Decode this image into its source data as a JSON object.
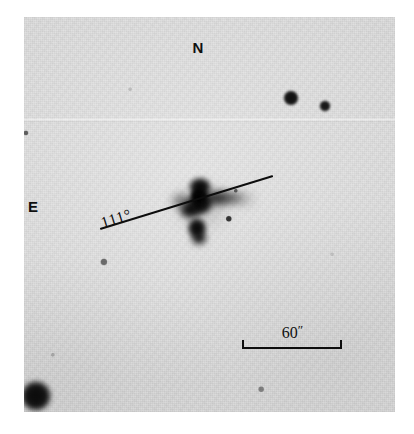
{
  "figure": {
    "type": "astronomical-plate-negative",
    "background_color": "#dcdcdc",
    "ink_color": "#0d0d0d",
    "frame": {
      "x": 24,
      "y": 17,
      "width": 371,
      "height": 395
    }
  },
  "annotations": {
    "position_angle": {
      "label": "111°",
      "line": {
        "x1": 100,
        "y1": 228,
        "x2": 273,
        "y2": 175
      },
      "label_x": 104,
      "label_y": 214,
      "angle_deg": -17
    },
    "compass": [
      {
        "name": "north-label",
        "label": "N",
        "x": 198,
        "y": 47
      },
      {
        "name": "east-label",
        "label": "E",
        "x": 33,
        "y": 206
      }
    ],
    "scale_bar": {
      "label": "60",
      "unit": "″",
      "x1": 242,
      "x2": 342,
      "y": 347
    }
  },
  "sources": [
    {
      "name": "star-ne-bright",
      "x": 291,
      "y": 98,
      "r": 7.5,
      "opacity": 0.96
    },
    {
      "name": "star-ne-faint",
      "x": 325,
      "y": 106,
      "r": 5.5,
      "opacity": 0.93
    },
    {
      "name": "star-sw-bright",
      "x": 36,
      "y": 396,
      "r": 15,
      "opacity": 0.98
    },
    {
      "name": "star-field-1",
      "x": 104,
      "y": 262,
      "r": 3.6,
      "opacity": 0.55
    },
    {
      "name": "star-field-2",
      "x": 229,
      "y": 219,
      "r": 3.2,
      "opacity": 0.8
    },
    {
      "name": "star-field-3",
      "x": 236,
      "y": 191,
      "r": 2.2,
      "opacity": 0.55
    },
    {
      "name": "star-field-4",
      "x": 261,
      "y": 389,
      "r": 2.8,
      "opacity": 0.42
    },
    {
      "name": "star-field-5",
      "x": 53,
      "y": 355,
      "r": 2.2,
      "opacity": 0.22
    },
    {
      "name": "star-edge-speck",
      "x": 26,
      "y": 133,
      "r": 2.6,
      "opacity": 0.6
    },
    {
      "name": "star-field-6",
      "x": 130,
      "y": 89,
      "r": 1.8,
      "opacity": 0.14
    },
    {
      "name": "star-field-7",
      "x": 332,
      "y": 254,
      "r": 1.8,
      "opacity": 0.12
    }
  ],
  "central_object": {
    "name": "peculiar-galaxy",
    "components": [
      {
        "name": "core-main",
        "x": 200,
        "y": 203,
        "rx": 15,
        "ry": 14,
        "opacity": 1.0,
        "blur": 2
      },
      {
        "name": "core-north",
        "x": 200,
        "y": 187,
        "rx": 13,
        "ry": 11,
        "opacity": 1.0,
        "blur": 2
      },
      {
        "name": "nucleus",
        "x": 199,
        "y": 196,
        "rx": 10,
        "ry": 10,
        "opacity": 1.0,
        "blur": 1
      },
      {
        "name": "lobe-southwest",
        "x": 190,
        "y": 210,
        "rx": 12,
        "ry": 10,
        "opacity": 0.96,
        "blur": 3
      },
      {
        "name": "lobe-south",
        "x": 197,
        "y": 228,
        "rx": 11,
        "ry": 12,
        "opacity": 1.0,
        "blur": 2
      },
      {
        "name": "lobe-south-tip",
        "x": 199,
        "y": 238,
        "rx": 9,
        "ry": 8,
        "opacity": 0.95,
        "blur": 3
      },
      {
        "name": "tail-inner",
        "x": 216,
        "y": 198,
        "rx": 16,
        "ry": 8,
        "opacity": 0.9,
        "blur": 4
      },
      {
        "name": "tail-mid",
        "x": 231,
        "y": 198,
        "rx": 14,
        "ry": 6,
        "opacity": 0.72,
        "blur": 5
      },
      {
        "name": "tail-outer",
        "x": 244,
        "y": 199,
        "rx": 11,
        "ry": 4,
        "opacity": 0.45,
        "blur": 6
      },
      {
        "name": "halo-west",
        "x": 182,
        "y": 201,
        "rx": 12,
        "ry": 8,
        "opacity": 0.55,
        "blur": 5
      },
      {
        "name": "halo-diffuse",
        "x": 203,
        "y": 207,
        "rx": 28,
        "ry": 22,
        "opacity": 0.16,
        "blur": 9
      }
    ]
  }
}
